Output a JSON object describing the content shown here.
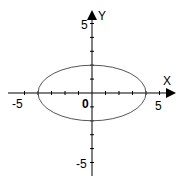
{
  "chart_data": {
    "type": "line",
    "title": "",
    "xlabel": "X",
    "ylabel": "Y",
    "xlim": [
      -5,
      5
    ],
    "ylim": [
      -5,
      5
    ],
    "x_ticks": [
      -5,
      -4,
      -3,
      -2,
      -1,
      0,
      1,
      2,
      3,
      4,
      5
    ],
    "y_ticks": [
      -5,
      -4,
      -3,
      -2,
      -1,
      0,
      1,
      2,
      3,
      4,
      5
    ],
    "tick_labels": {
      "x": [
        "-5",
        "0",
        "5"
      ],
      "y": [
        "5",
        "-5"
      ]
    },
    "grid": false,
    "series": [
      {
        "name": "ellipse",
        "equation": "x^2/16 + y^2/4 = 1",
        "center": [
          0,
          0
        ],
        "semi_axis_x": 4,
        "semi_axis_y": 2
      }
    ]
  },
  "labels": {
    "x_axis": "X",
    "y_axis": "Y",
    "x_min": "-5",
    "x_max": "5",
    "y_max": "5",
    "y_min": "-5",
    "origin": "0"
  },
  "colors": {
    "axis": "#000000",
    "curve": "#555555"
  }
}
